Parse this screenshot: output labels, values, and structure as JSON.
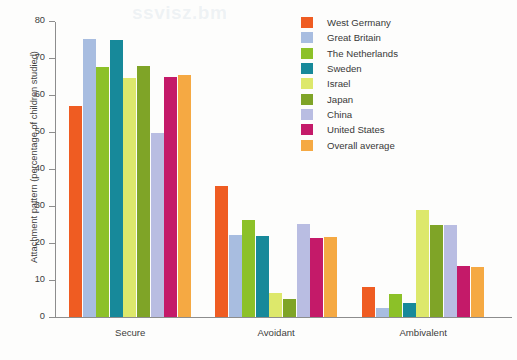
{
  "figure": {
    "background": "#fdfdfc",
    "axis_color": "#8d8d8d",
    "text_color": "#3d3d3d",
    "bleed_text": "ssvisz.bm"
  },
  "legend": {
    "position": "top-right",
    "entries": [
      {
        "label": "West Germany",
        "color": "#ef5c22"
      },
      {
        "label": "Great Britain",
        "color": "#a8bde0"
      },
      {
        "label": "The Netherlands",
        "color": "#8cc128"
      },
      {
        "label": "Sweden",
        "color": "#17899a"
      },
      {
        "label": "Israel",
        "color": "#dde86b"
      },
      {
        "label": "Japan",
        "color": "#7fa427"
      },
      {
        "label": "China",
        "color": "#b9bde2"
      },
      {
        "label": "United States",
        "color": "#c41a69"
      },
      {
        "label": "Overall average",
        "color": "#f5a943"
      }
    ]
  },
  "chart_data": {
    "type": "bar",
    "title": "",
    "xlabel": "",
    "ylabel": "Attachment pattern (percentage of children studied)",
    "categories": [
      "Secure",
      "Avoidant",
      "Ambivalent"
    ],
    "ylim": [
      0,
      80
    ],
    "yticks": [
      0,
      10,
      20,
      30,
      40,
      50,
      60,
      70,
      80
    ],
    "grid": false,
    "series": [
      {
        "name": "West Germany",
        "color": "#ef5c22",
        "values": [
          57.0,
          35.5,
          8.0
        ]
      },
      {
        "name": "Great Britain",
        "color": "#a8bde0",
        "values": [
          75.2,
          22.3,
          2.4
        ]
      },
      {
        "name": "The Netherlands",
        "color": "#8cc128",
        "values": [
          67.5,
          26.3,
          6.2
        ]
      },
      {
        "name": "Sweden",
        "color": "#17899a",
        "values": [
          74.8,
          22.0,
          3.8
        ]
      },
      {
        "name": "Israel",
        "color": "#dde86b",
        "values": [
          64.5,
          6.6,
          28.8
        ]
      },
      {
        "name": "Japan",
        "color": "#7fa427",
        "values": [
          67.8,
          4.8,
          25.0
        ]
      },
      {
        "name": "China",
        "color": "#b9bde2",
        "values": [
          49.7,
          25.2,
          25.0
        ]
      },
      {
        "name": "United States",
        "color": "#c41a69",
        "values": [
          65.0,
          21.3,
          13.8
        ]
      },
      {
        "name": "Overall average",
        "color": "#f5a943",
        "values": [
          65.3,
          21.6,
          13.5
        ]
      }
    ]
  }
}
